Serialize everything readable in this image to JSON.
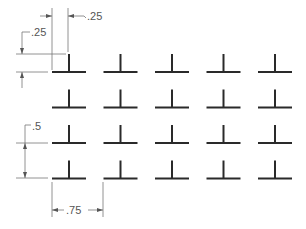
{
  "diagram": {
    "type": "dimensioned-grid",
    "colors": {
      "shape": "#2a2a2a",
      "dimension": "#777777",
      "text": "#555555",
      "background": "#ffffff"
    },
    "grid": {
      "rows": 4,
      "columns": 5,
      "shape": "inverted-T",
      "column_spacing": ".75",
      "row_spacing": ".5"
    },
    "dimensions": {
      "top_horizontal": {
        "label": ".25",
        "description": "stem offset from bar start"
      },
      "left_vertical_top": {
        "label": ".25",
        "description": "stem height"
      },
      "left_vertical_bottom": {
        "label": ".5",
        "description": "row spacing"
      },
      "bottom_horizontal": {
        "label": ".75",
        "description": "column spacing"
      }
    }
  }
}
